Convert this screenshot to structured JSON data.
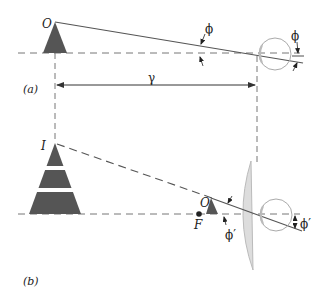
{
  "figure": {
    "panel_a": {
      "label": "(a)",
      "object_label": "O",
      "angle_label": "ϕ",
      "angle_label_eye": "ϕ",
      "distance_label": "γ"
    },
    "panel_b": {
      "label": "(b)",
      "image_label": "I",
      "object_label": "O",
      "focal_label": "F",
      "angle_label": "ϕ′",
      "angle_label_eye": "ϕ′"
    },
    "colors": {
      "object_fill": "#555555",
      "line": "#555555",
      "dashed": "#777777",
      "eye": "#aaaaaa",
      "lens_fill": "#dddddd",
      "lens_stroke": "#bbbbbb"
    }
  }
}
